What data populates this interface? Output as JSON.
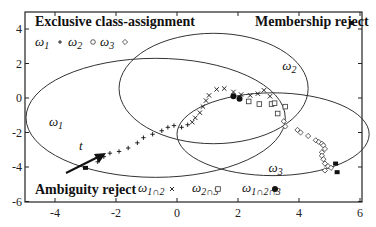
{
  "chart_data": {
    "type": "scatter",
    "title": "",
    "xlabel": "",
    "ylabel": "",
    "xlim": [
      -5,
      6
    ],
    "ylim": [
      -6,
      5
    ],
    "x_ticks": [
      "-4",
      "-2",
      "0",
      "2",
      "4",
      "6"
    ],
    "y_ticks": [
      "4",
      "2",
      "0",
      "-2",
      "-4",
      "-6"
    ],
    "grid": false,
    "annotations": {
      "top_left": "Exclusive class-assignment",
      "top_right": "Membership reject",
      "bottom_left": "Ambiguity reject",
      "time_arrow": "t"
    },
    "legend_top": [
      {
        "label": "ω1",
        "marker": "+"
      },
      {
        "label": "ω2",
        "marker": "o"
      },
      {
        "label": "ω3",
        "marker": "◇"
      }
    ],
    "legend_bottom": [
      {
        "label": "ω1∩2",
        "marker": "×"
      },
      {
        "label": "ω2∩3",
        "marker": "□"
      },
      {
        "label": "ω1∩2∩3",
        "marker": "●"
      }
    ],
    "ellipses": [
      {
        "name": "ω1",
        "cx": -0.7,
        "cy": -1.15,
        "rx": 4.25,
        "ry": 3.45,
        "label_pos": [
          -4.2,
          -1.6
        ]
      },
      {
        "name": "ω2",
        "cx": 1.2,
        "cy": 0.55,
        "rx": 3.1,
        "ry": 3.2,
        "label_pos": [
          3.45,
          1.65
        ]
      },
      {
        "name": "ω3",
        "cx": 3.15,
        "cy": -2.1,
        "rx": 3.15,
        "ry": 2.4,
        "label_pos": [
          3.0,
          -4.3
        ]
      }
    ],
    "series": [
      {
        "name": "membership reject",
        "marker": "square-filled",
        "points": [
          [
            -3.0,
            -4.05
          ],
          [
            5.2,
            -3.8
          ],
          [
            5.25,
            -4.3
          ]
        ]
      },
      {
        "name": "ω1",
        "marker": "+",
        "points": [
          [
            -2.6,
            -3.7
          ],
          [
            -2.4,
            -3.4
          ],
          [
            -2.2,
            -3.2
          ],
          [
            -1.9,
            -3.1
          ],
          [
            -1.6,
            -2.9
          ],
          [
            -1.3,
            -2.6
          ],
          [
            -1.1,
            -2.3
          ],
          [
            -0.8,
            -2.1
          ],
          [
            -0.5,
            -1.9
          ],
          [
            -0.3,
            -1.7
          ],
          [
            -0.1,
            -1.6
          ],
          [
            0.15,
            -1.7
          ],
          [
            0.35,
            -1.55
          ]
        ]
      },
      {
        "name": "ω1∩2",
        "marker": "x",
        "points": [
          [
            0.5,
            -1.4
          ],
          [
            0.6,
            -1.15
          ],
          [
            0.75,
            -0.85
          ],
          [
            0.85,
            -0.5
          ],
          [
            0.95,
            -0.15
          ],
          [
            1.05,
            0.15
          ],
          [
            1.3,
            0.5
          ],
          [
            1.55,
            0.55
          ],
          [
            1.85,
            0.35
          ],
          [
            2.1,
            0.2
          ],
          [
            2.4,
            0.15
          ],
          [
            2.65,
            0.25
          ],
          [
            2.85,
            0.45
          ],
          [
            3.05,
            0.1
          ]
        ]
      },
      {
        "name": "ω1∩2∩3",
        "marker": "circle-filled",
        "points": [
          [
            1.85,
            0.1
          ],
          [
            2.05,
            -0.05
          ]
        ]
      },
      {
        "name": "ω2∩3",
        "marker": "square-open",
        "points": [
          [
            2.35,
            -0.2
          ],
          [
            2.7,
            -0.35
          ],
          [
            3.1,
            -0.35
          ],
          [
            3.2,
            -0.3
          ],
          [
            3.55,
            -0.5
          ],
          [
            3.3,
            -0.9
          ]
        ]
      },
      {
        "name": "ω3",
        "marker": "diamond-open",
        "points": [
          [
            3.5,
            -1.35
          ],
          [
            3.55,
            -1.65
          ],
          [
            3.95,
            -1.85
          ],
          [
            4.05,
            -2.0
          ],
          [
            4.3,
            -2.2
          ],
          [
            4.55,
            -2.45
          ],
          [
            4.65,
            -2.55
          ],
          [
            4.75,
            -2.65
          ],
          [
            4.8,
            -2.75
          ],
          [
            4.85,
            -2.95
          ],
          [
            4.75,
            -3.15
          ],
          [
            4.75,
            -3.35
          ],
          [
            4.8,
            -3.55
          ],
          [
            4.85,
            -3.8
          ],
          [
            4.95,
            -3.95
          ],
          [
            4.85,
            -4.2
          ],
          [
            5.05,
            -4.05
          ]
        ]
      }
    ]
  }
}
